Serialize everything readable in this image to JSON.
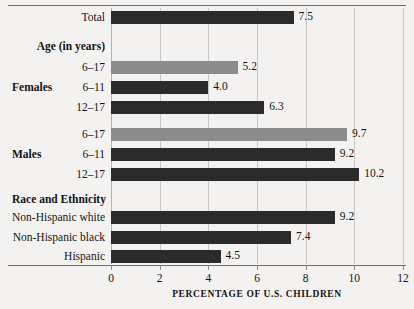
{
  "chart_data": {
    "type": "bar",
    "orientation": "horizontal",
    "title": "",
    "subtitle": "",
    "xlabel": "PERCENTAGE OF U.S. CHILDREN",
    "ylabel": "",
    "xlim": [
      0,
      12
    ],
    "xticks": [
      0,
      2,
      4,
      6,
      8,
      10,
      12
    ],
    "xtick_labels": [
      "0",
      "2",
      "4",
      "6",
      "8",
      "10",
      "12"
    ],
    "grid": true,
    "legend": "none",
    "categories": [
      "Total",
      "6–17",
      "6–11",
      "12–17",
      "6–17",
      "6–11",
      "12–17",
      "Non-Hispanic white",
      "Non-Hispanic black",
      "Hispanic"
    ],
    "values": [
      7.5,
      5.2,
      4.0,
      6.3,
      9.7,
      9.2,
      10.2,
      9.2,
      7.4,
      4.5
    ],
    "section_headers": [
      "Age (in years)",
      "Race and Ethnicity"
    ],
    "group_labels": [
      "Females",
      "Males"
    ],
    "rows": [
      {
        "kind": "bar",
        "label": "Total",
        "group": "",
        "value": 7.5,
        "value_text": "7.5",
        "shade": "dark",
        "y": 8
      },
      {
        "kind": "header",
        "label": "Age (in years)",
        "group": "",
        "value": null,
        "value_text": "",
        "shade": "",
        "y": 37
      },
      {
        "kind": "bar",
        "label": "6–17",
        "group": "",
        "value": 5.2,
        "value_text": "5.2",
        "shade": "light",
        "y": 58
      },
      {
        "kind": "bar",
        "label": "6–11",
        "group": "Females",
        "value": 4.0,
        "value_text": "4.0",
        "shade": "dark",
        "y": 78
      },
      {
        "kind": "bar",
        "label": "12–17",
        "group": "",
        "value": 6.3,
        "value_text": "6.3",
        "shade": "dark",
        "y": 98
      },
      {
        "kind": "bar",
        "label": "6–17",
        "group": "",
        "value": 9.7,
        "value_text": "9.7",
        "shade": "light",
        "y": 125
      },
      {
        "kind": "bar",
        "label": "6–11",
        "group": "Males",
        "value": 9.2,
        "value_text": "9.2",
        "shade": "dark",
        "y": 145
      },
      {
        "kind": "bar",
        "label": "12–17",
        "group": "",
        "value": 10.2,
        "value_text": "10.2",
        "shade": "dark",
        "y": 165
      },
      {
        "kind": "header",
        "label": "Race and Ethnicity",
        "group": "",
        "value": null,
        "value_text": "",
        "shade": "",
        "y": 190
      },
      {
        "kind": "bar",
        "label": "Non-Hispanic white",
        "group": "",
        "value": 9.2,
        "value_text": "9.2",
        "shade": "dark",
        "y": 208
      },
      {
        "kind": "bar",
        "label": "Non-Hispanic black",
        "group": "",
        "value": 7.4,
        "value_text": "7.4",
        "shade": "dark",
        "y": 228
      },
      {
        "kind": "bar",
        "label": "Hispanic",
        "group": "",
        "value": 4.5,
        "value_text": "4.5",
        "shade": "dark",
        "y": 247
      }
    ]
  },
  "colors": {
    "background": "#f3f2f0",
    "bar_dark": "#2b2b2b",
    "bar_light": "#8c8c8c",
    "gridline": "#c9c8c5",
    "rule": "#6d6d6d",
    "text": "#141414"
  }
}
